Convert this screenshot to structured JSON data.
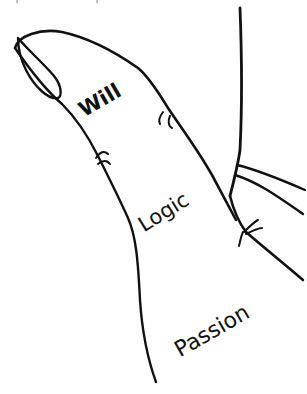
{
  "diagram": {
    "labels": {
      "tip": "Will",
      "middle": "Logic",
      "base": "Passion"
    },
    "colors": {
      "line": "#111111",
      "background": "#ffffff"
    }
  }
}
